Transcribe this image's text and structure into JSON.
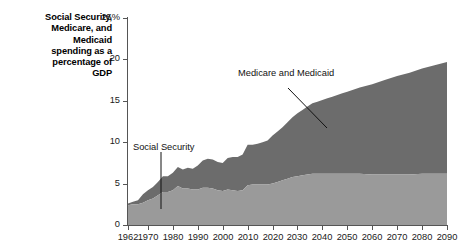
{
  "title": {
    "line1": "Social Security,",
    "line2": "Medicare, and",
    "line3": "Medicaid",
    "line4": "spending as a",
    "line5": "percentage of",
    "line6": "GDP"
  },
  "annotations": {
    "social_security": "Social Security",
    "medicare_medicaid": "Medicare and Medicaid"
  },
  "colors": {
    "social_security": "#9a9a9a",
    "medicare_medicaid": "#6c6c6c",
    "axis": "#555555",
    "text": "#111111",
    "background": "#ffffff"
  },
  "chart_data": {
    "type": "area",
    "stacked": true,
    "title": "Social Security, Medicare, and Medicaid spending as a percentage of GDP",
    "xlabel": "",
    "ylabel": "",
    "xlim": [
      1962,
      2090
    ],
    "ylim": [
      0,
      25
    ],
    "grid": false,
    "legend": "inline-annotations",
    "ytick_labels": [
      "0",
      "5",
      "10",
      "15",
      "20",
      "25%"
    ],
    "ytick_values": [
      0,
      5,
      10,
      15,
      20,
      25
    ],
    "xtick_labels": [
      "1962",
      "1970",
      "1980",
      "1990",
      "2000",
      "2010",
      "2020",
      "2030",
      "2040",
      "2050",
      "2060",
      "2070",
      "2080",
      "2090"
    ],
    "xtick_values": [
      1962,
      1970,
      1980,
      1990,
      2000,
      2010,
      2020,
      2030,
      2040,
      2050,
      2060,
      2070,
      2080,
      2090
    ],
    "x": [
      1962,
      1964,
      1966,
      1968,
      1970,
      1972,
      1974,
      1976,
      1978,
      1980,
      1982,
      1984,
      1986,
      1988,
      1990,
      1992,
      1994,
      1996,
      1998,
      2000,
      2002,
      2004,
      2006,
      2008,
      2010,
      2012,
      2014,
      2016,
      2018,
      2020,
      2022,
      2024,
      2026,
      2028,
      2030,
      2032,
      2034,
      2036,
      2038,
      2040,
      2042,
      2044,
      2046,
      2048,
      2050,
      2055,
      2060,
      2065,
      2070,
      2075,
      2080,
      2085,
      2090
    ],
    "series": [
      {
        "name": "Social Security",
        "values": [
          2.4,
          2.5,
          2.5,
          2.7,
          3.0,
          3.2,
          3.6,
          4.0,
          4.0,
          4.2,
          4.7,
          4.4,
          4.4,
          4.3,
          4.3,
          4.5,
          4.5,
          4.4,
          4.2,
          4.1,
          4.3,
          4.2,
          4.1,
          4.2,
          4.8,
          4.9,
          4.9,
          4.9,
          4.9,
          5.0,
          5.2,
          5.4,
          5.6,
          5.8,
          5.9,
          6.0,
          6.1,
          6.2,
          6.2,
          6.2,
          6.2,
          6.2,
          6.2,
          6.2,
          6.2,
          6.2,
          6.1,
          6.1,
          6.1,
          6.1,
          6.2,
          6.2,
          6.2
        ]
      },
      {
        "name": "Medicare and Medicaid",
        "values": [
          0.2,
          0.3,
          0.5,
          1.0,
          1.2,
          1.4,
          1.6,
          1.9,
          1.9,
          2.1,
          2.3,
          2.3,
          2.5,
          2.5,
          2.9,
          3.3,
          3.5,
          3.5,
          3.4,
          3.4,
          3.8,
          4.0,
          4.1,
          4.3,
          4.9,
          4.8,
          4.9,
          5.1,
          5.3,
          5.8,
          6.1,
          6.4,
          6.8,
          7.2,
          7.6,
          7.9,
          8.2,
          8.5,
          8.7,
          8.9,
          9.1,
          9.3,
          9.5,
          9.7,
          9.9,
          10.4,
          10.9,
          11.4,
          11.9,
          12.3,
          12.7,
          13.1,
          13.5
        ]
      }
    ],
    "totals_note": "Top of stacked area reaches about 19.7 percent of GDP in 2090."
  }
}
